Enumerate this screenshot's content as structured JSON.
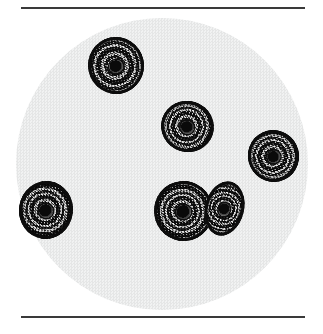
{
  "figure": {
    "name": "photomicrograph-figure",
    "kind": "light-micrograph",
    "page_background": "#ffffff",
    "width": 323,
    "height": 334
  },
  "rules": {
    "color": "#3a3a3a",
    "thickness_px": 2,
    "left_px": 21,
    "width_px": 284,
    "top_rule_y": 7,
    "bottom_rule_y": 316
  },
  "field": {
    "name": "microscope-field",
    "shape": "circle",
    "center_x": 162,
    "center_y": 164,
    "radius": 146,
    "fill": "#f0f1f1",
    "texture": "halftone-dither"
  },
  "specimens": {
    "count": 7,
    "appearance": "dark concentric-ringed speckled cysts",
    "ring_dark": "#141414",
    "ring_light": "#d8d8d8",
    "items": [
      {
        "id": "cell-1",
        "label": "cyst-upper-left",
        "x": 88,
        "y": 37,
        "w": 56,
        "h": 57,
        "rotate": -12,
        "rings": 5
      },
      {
        "id": "cell-2",
        "label": "cyst-center",
        "x": 161,
        "y": 101,
        "w": 53,
        "h": 51,
        "rotate": 18,
        "rings": 5
      },
      {
        "id": "cell-3",
        "label": "cyst-right",
        "x": 248,
        "y": 130,
        "w": 51,
        "h": 52,
        "rotate": -25,
        "rings": 5
      },
      {
        "id": "cell-4",
        "label": "cyst-left-edge",
        "x": 19,
        "y": 181,
        "w": 54,
        "h": 58,
        "rotate": 8,
        "rings": 6
      },
      {
        "id": "cell-5",
        "label": "cyst-pair-large",
        "x": 154,
        "y": 181,
        "w": 59,
        "h": 60,
        "rotate": -6,
        "rings": 6
      },
      {
        "id": "cell-6",
        "label": "cyst-pair-small",
        "x": 205,
        "y": 181,
        "w": 39,
        "h": 55,
        "rotate": 14,
        "rings": 5
      }
    ]
  }
}
